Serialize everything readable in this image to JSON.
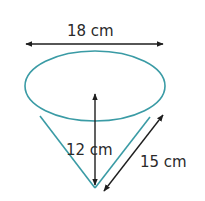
{
  "diagram": {
    "type": "cone-dimensions",
    "labels": {
      "diameter": "18 cm",
      "height": "12 cm",
      "slant_height": "15 cm"
    },
    "colors": {
      "shape_stroke": "#3a9ba5",
      "arrow": "#1e1e1e",
      "text": "#2a2a2a",
      "background": "#ffffff"
    }
  }
}
